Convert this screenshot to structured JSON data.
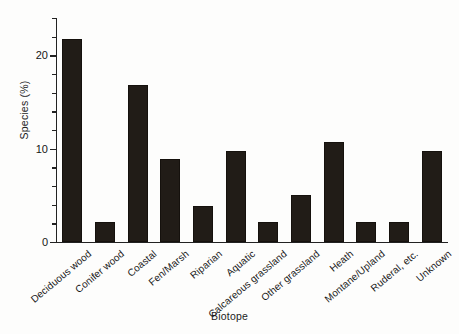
{
  "chart_data": {
    "type": "bar",
    "title": "",
    "xlabel": "Biotope",
    "ylabel": "Species (%)",
    "ylim": [
      0,
      24
    ],
    "yticks": [
      0,
      10,
      20
    ],
    "ytick_labels": [
      "0",
      "10",
      "20"
    ],
    "yminor_step": 2,
    "grid": false,
    "legend": "none",
    "bar_color": "#211c17",
    "categories": [
      "Deciduous wood",
      "Conifer wood",
      "Coastal",
      "Fen/Marsh",
      "Riparian",
      "Aquatic",
      "Calcareous grassland",
      "Other grassland",
      "Heath",
      "Montane/Upland",
      "Ruderal, etc.",
      "Unknown"
    ],
    "values": [
      21.7,
      2.1,
      16.8,
      8.9,
      3.9,
      9.8,
      2.1,
      5.0,
      10.7,
      2.1,
      2.1,
      9.8
    ]
  },
  "axes": {
    "y_title": "Species (%)",
    "x_title": "Biotope"
  }
}
